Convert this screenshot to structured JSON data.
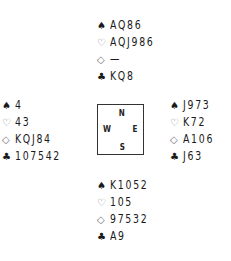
{
  "diagram": {
    "type": "bridge-deal",
    "suit_symbols": {
      "spades": "♠",
      "hearts": "♡",
      "diamonds": "◇",
      "clubs": "♣"
    },
    "compass": {
      "north": "N",
      "west": "W",
      "east": "E",
      "south": "S"
    },
    "hands": {
      "north": {
        "spades": "AQ86",
        "hearts": "AQJ986",
        "diamonds": "—",
        "clubs": "KQ8"
      },
      "west": {
        "spades": "4",
        "hearts": "43",
        "diamonds": "KQJ84",
        "clubs": "107542"
      },
      "east": {
        "spades": "J973",
        "hearts": "K72",
        "diamonds": "A106",
        "clubs": "J63"
      },
      "south": {
        "spades": "K1052",
        "hearts": "105",
        "diamonds": "97532",
        "clubs": "A9"
      }
    }
  }
}
